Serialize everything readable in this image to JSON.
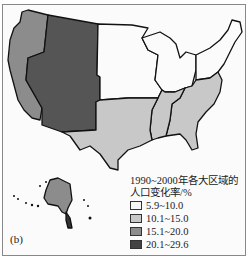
{
  "map": {
    "panel_label": "(b)",
    "regions": [
      {
        "name": "Pacific",
        "class": "15.1~20.0",
        "color": "#8c8c8c"
      },
      {
        "name": "Mountain",
        "class": "20.1~29.6",
        "color": "#555555"
      },
      {
        "name": "West North Central",
        "class": "5.9~10.0",
        "color": "#fbfbfb"
      },
      {
        "name": "East North Central",
        "class": "5.9~10.0",
        "color": "#fbfbfb"
      },
      {
        "name": "New England",
        "class": "5.9~10.0",
        "color": "#fbfbfb"
      },
      {
        "name": "Middle Atlantic",
        "class": "5.9~10.0",
        "color": "#fbfbfb"
      },
      {
        "name": "West South Central",
        "class": "10.1~15.0",
        "color": "#c8c8c8"
      },
      {
        "name": "East South Central",
        "class": "10.1~15.0",
        "color": "#c8c8c8"
      },
      {
        "name": "South Atlantic",
        "class": "15.1~20.0",
        "color": "#c8c8c8"
      },
      {
        "name": "Alaska",
        "class": "15.1~20.0",
        "color": "#8c8c8c"
      }
    ]
  },
  "legend": {
    "title_line1": "1990~2000年各大区域的",
    "title_line2": "人口变化率/%",
    "items": [
      {
        "label": "5.9~10.0",
        "color": "#f7f7f7"
      },
      {
        "label": "10.1~15.0",
        "color": "#c8c8c8"
      },
      {
        "label": "15.1~20.0",
        "color": "#8c8c8c"
      },
      {
        "label": "20.1~29.6",
        "color": "#444444"
      }
    ]
  }
}
